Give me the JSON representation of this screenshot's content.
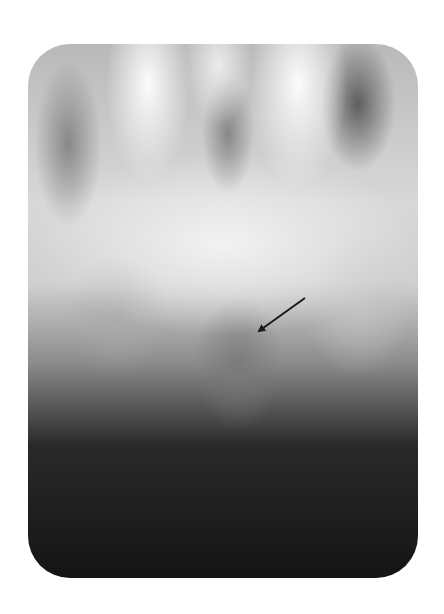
{
  "figure": {
    "type": "radiograph",
    "annotation": {
      "kind": "arrow",
      "from": [
        305,
        298
      ],
      "to": [
        257,
        332
      ],
      "color": "#1a1a1a"
    },
    "frame": {
      "x": 28,
      "y": 44,
      "width": 390,
      "height": 534,
      "corner_radius": 42
    },
    "colors": {
      "background": "#ffffff",
      "bright": "#f5f5f5",
      "dark": "#141414"
    }
  }
}
